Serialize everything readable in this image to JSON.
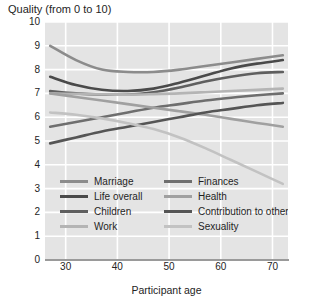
{
  "chart_data": {
    "type": "line",
    "title": "Quality (from 0 to 10)",
    "xlabel": "Participant age",
    "ylabel": "",
    "xlim": [
      26,
      73
    ],
    "ylim": [
      0,
      10
    ],
    "xticks": [
      30,
      40,
      50,
      60,
      70
    ],
    "yticks": [
      0,
      1,
      2,
      3,
      4,
      5,
      6,
      7,
      8,
      9,
      10
    ],
    "grid": true,
    "legend_position": "inside-bottom-left",
    "plot_background": "#e4e4e4",
    "gridline_color": "#ffffff",
    "series": [
      {
        "name": "Marriage",
        "color": "#8c8c8c",
        "x": [
          27,
          32,
          37,
          42,
          47,
          52,
          57,
          62,
          67,
          72
        ],
        "values": [
          9.0,
          8.4,
          8.0,
          7.9,
          7.9,
          8.0,
          8.15,
          8.3,
          8.45,
          8.6
        ]
      },
      {
        "name": "Life overall",
        "color": "#4a4a4a",
        "x": [
          27,
          32,
          37,
          42,
          47,
          52,
          57,
          62,
          67,
          72
        ],
        "values": [
          7.7,
          7.35,
          7.15,
          7.1,
          7.2,
          7.45,
          7.75,
          8.05,
          8.25,
          8.4
        ]
      },
      {
        "name": "Children",
        "color": "#5f5f5f",
        "x": [
          27,
          32,
          37,
          42,
          47,
          52,
          57,
          62,
          67,
          72
        ],
        "values": [
          7.1,
          7.0,
          6.95,
          6.95,
          7.05,
          7.25,
          7.5,
          7.7,
          7.85,
          7.9
        ]
      },
      {
        "name": "Work",
        "color": "#b4b4b4",
        "x": [
          27,
          32,
          37,
          42,
          47,
          52,
          57,
          62,
          67,
          72
        ],
        "values": [
          7.0,
          6.98,
          6.96,
          6.95,
          6.97,
          7.0,
          7.05,
          7.1,
          7.15,
          7.2
        ]
      },
      {
        "name": "Finances",
        "color": "#6e6e6e",
        "x": [
          27,
          32,
          37,
          42,
          47,
          52,
          57,
          62,
          67,
          72
        ],
        "values": [
          5.6,
          5.8,
          6.0,
          6.2,
          6.4,
          6.55,
          6.7,
          6.82,
          6.92,
          7.0
        ]
      },
      {
        "name": "Health",
        "color": "#a0a0a0",
        "x": [
          27,
          32,
          37,
          42,
          47,
          52,
          57,
          62,
          67,
          72
        ],
        "values": [
          7.0,
          6.85,
          6.7,
          6.55,
          6.4,
          6.25,
          6.1,
          5.93,
          5.76,
          5.6
        ]
      },
      {
        "name": "Contribution to others",
        "color": "#555555",
        "x": [
          27,
          32,
          37,
          42,
          47,
          52,
          57,
          62,
          67,
          72
        ],
        "values": [
          4.9,
          5.15,
          5.4,
          5.6,
          5.8,
          6.0,
          6.2,
          6.35,
          6.5,
          6.6
        ]
      },
      {
        "name": "Sexuality",
        "color": "#c2c2c2",
        "x": [
          27,
          32,
          37,
          42,
          47,
          52,
          57,
          62,
          67,
          72
        ],
        "values": [
          6.2,
          6.1,
          5.95,
          5.75,
          5.5,
          5.15,
          4.7,
          4.2,
          3.7,
          3.2
        ]
      }
    ]
  },
  "legend": {
    "columns": [
      [
        "Marriage",
        "Life overall",
        "Children",
        "Work"
      ],
      [
        "Finances",
        "Health",
        "Contribution to others",
        "Sexuality"
      ]
    ]
  }
}
